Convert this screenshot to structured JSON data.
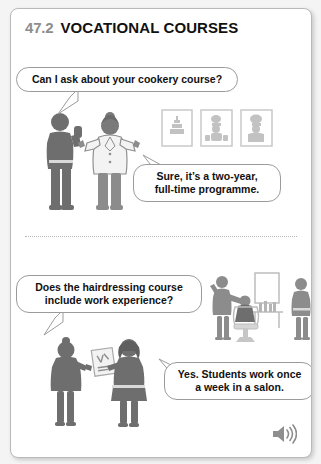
{
  "page": {
    "background_color": "#f4f4f4",
    "card_background": "#ffffff",
    "border_color": "#b9b9b9"
  },
  "header": {
    "section_number": "47.2",
    "title": "VOCATIONAL COURSES",
    "number_color": "#8d8d8d",
    "title_color": "#111111"
  },
  "dialogues": [
    {
      "id": "q1",
      "speaker": "student",
      "text": "Can I ask about your cookery course?",
      "tail_direction": "down-left"
    },
    {
      "id": "a1",
      "speaker": "chef-teacher",
      "text": "Sure, it’s a two-year,\nfull-time programme.",
      "line1": "Sure, it’s a two-year,",
      "line2": "full-time programme.",
      "tail_direction": "up-left"
    },
    {
      "id": "q2",
      "speaker": "student",
      "text": "Does the hairdressing course\ninclude work experience?",
      "line1": "Does the hairdressing course",
      "line2": "include work experience?",
      "tail_direction": "down-left"
    },
    {
      "id": "a2",
      "speaker": "hairdressing-tutor",
      "text": "Yes. Students work once\na week in a salon.",
      "line1": "Yes. Students work once",
      "line2": "a week in a salon.",
      "tail_direction": "up-left"
    }
  ],
  "illustrations": [
    {
      "id": "cookery-scene",
      "name": "cookery-figures-illustration",
      "description": "Student with raised hand talking to a chef in a white jacket"
    },
    {
      "id": "wall-frames",
      "name": "framed-cookery-pictures",
      "description": "Three framed pictures of a tiered cake and chefs cooking",
      "count": 3
    },
    {
      "id": "salon-scene",
      "name": "hair-salon-illustration",
      "description": "Hairdresser cutting a seated client's hair beside a mirror, counter with bottles, and a standing observer"
    },
    {
      "id": "hairdressing-pair",
      "name": "hairdressing-figures-illustration",
      "description": "Two women talking, one holding a clipboard"
    }
  ],
  "controls": {
    "audio": {
      "name": "audio-play-button",
      "icon": "speaker-icon",
      "label": "Play audio"
    }
  },
  "divider": {
    "style": "dotted",
    "color": "#b5b5b5"
  },
  "colors": {
    "figure_dark": "#6e6e6e",
    "figure_mid": "#8c8c8c",
    "figure_light": "#d8d8d8",
    "outline": "#9b9b9b",
    "frame_line": "#cfcfcf"
  }
}
